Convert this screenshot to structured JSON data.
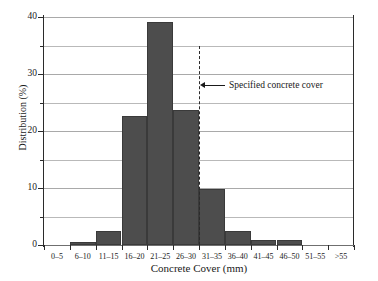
{
  "chart_data": {
    "type": "bar",
    "title": "",
    "xlabel": "Concrete Cover (mm)",
    "ylabel": "Distribution (%)",
    "categories": [
      "0–5",
      "6–10",
      "11–15",
      "16–20",
      "21–25",
      "26–30",
      "31–35",
      "36–40",
      "41–45",
      "46–50",
      "51–55",
      ">55"
    ],
    "values": [
      0,
      0.6,
      2.4,
      22.6,
      39.2,
      23.7,
      9.8,
      2.5,
      0.9,
      0.9,
      0,
      0
    ],
    "ylim": [
      0,
      40
    ],
    "yticks": [
      0,
      10,
      20,
      30,
      40
    ],
    "ytick_labels": [
      "0",
      "10",
      "20",
      "30",
      "40"
    ],
    "yminor_ticks": [
      5,
      15,
      25,
      35
    ],
    "gridlines": [
      5,
      10,
      15,
      20,
      25,
      30,
      35,
      40
    ],
    "grid": true,
    "legend": "none",
    "bar_color": "#4d4d4d",
    "grid_color": "#b9b9b9",
    "axis_color": "#2b2b2b",
    "annotations": [
      {
        "text": "Specified concrete cover",
        "marker": "dashed-vertical-line",
        "at_category_boundary": "26–30 / 31–35",
        "at_value_mm": 30,
        "y_top": 35,
        "y_label": 28
      }
    ]
  },
  "figure": {
    "background": "#ffffff"
  }
}
